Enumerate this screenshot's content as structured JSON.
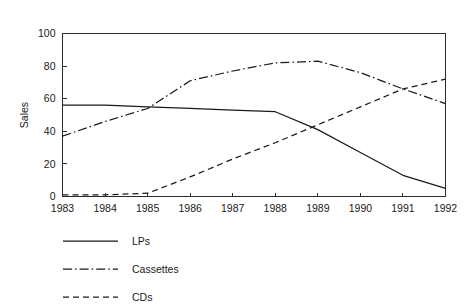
{
  "chart_data": {
    "type": "line",
    "title": "",
    "xlabel": "",
    "ylabel": "Sales",
    "x": [
      1983,
      1984,
      1985,
      1986,
      1987,
      1988,
      1989,
      1990,
      1991,
      1992
    ],
    "categories": [
      "1983",
      "1984",
      "1985",
      "1986",
      "1987",
      "1988",
      "1989",
      "1990",
      "1991",
      "1992"
    ],
    "xlim": [
      1983,
      1992
    ],
    "ylim": [
      0,
      100
    ],
    "yticks": [
      0,
      20,
      40,
      60,
      80,
      100
    ],
    "ytick_labels": [
      "0",
      "20",
      "40",
      "60",
      "80",
      "100"
    ],
    "xticks": [
      1983,
      1984,
      1985,
      1986,
      1987,
      1988,
      1989,
      1990,
      1991,
      1992
    ],
    "grid": false,
    "legend_position": "below-left",
    "series": [
      {
        "name": "LPs",
        "style": "solid",
        "color": "#1a1a1a",
        "values": [
          56,
          56,
          55,
          54,
          53,
          52,
          41,
          27,
          13,
          5
        ]
      },
      {
        "name": "Cassettes",
        "style": "dash-dot",
        "color": "#1a1a1a",
        "values": [
          37,
          46,
          54,
          71,
          77,
          82,
          83,
          76,
          66,
          57
        ]
      },
      {
        "name": "CDs",
        "style": "dashed",
        "color": "#1a1a1a",
        "values": [
          1,
          1,
          2,
          12,
          23,
          33,
          44,
          55,
          66,
          72
        ]
      }
    ]
  },
  "axes": {
    "y_title": "Sales"
  },
  "legend": {
    "entries": [
      {
        "label": "LPs"
      },
      {
        "label": "Cassettes"
      },
      {
        "label": "CDs"
      }
    ]
  }
}
